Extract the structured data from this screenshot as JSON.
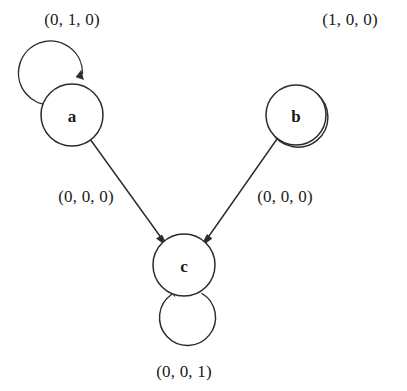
{
  "diagram": {
    "type": "state-transition-graph",
    "title": "",
    "stroke_color": "#2b2b2b",
    "label_color": "#1a1a1a",
    "background_color": "#ffffff",
    "nodes": [
      {
        "id": "a",
        "label": "a",
        "cx": 72,
        "cy": 115,
        "r": 31
      },
      {
        "id": "b",
        "label": "b",
        "cx": 296,
        "cy": 115,
        "r": 30
      },
      {
        "id": "c",
        "label": "c",
        "cx": 184,
        "cy": 265,
        "r": 31
      }
    ],
    "self_loops": [
      {
        "id": "loop-a",
        "node": "a",
        "label": "(0, 1, 0)",
        "label_x": 72,
        "label_y": 19,
        "cx": 52,
        "cy": 67,
        "r": 32
      },
      {
        "id": "loop-b",
        "node": "b",
        "label": "(1, 0, 0)",
        "label_x": 350,
        "label_y": 19,
        "cx": 330,
        "cy": 66,
        "r": 30
      },
      {
        "id": "loop-c",
        "node": "c",
        "label": "(0, 0, 1)",
        "label_x": 184,
        "label_y": 371,
        "cx": 183,
        "cy": 320,
        "r": 28
      }
    ],
    "edges": [
      {
        "id": "edge-a-c",
        "from": "a",
        "to": "c",
        "label": "(0, 0, 0)",
        "label_x": 86,
        "label_y": 196,
        "x1": 90,
        "y1": 139,
        "x2": 165,
        "y2": 243
      },
      {
        "id": "edge-b-c",
        "from": "b",
        "to": "c",
        "label": "(0, 0, 0)",
        "label_x": 285,
        "label_y": 196,
        "x1": 277,
        "y1": 139,
        "x2": 204,
        "y2": 243
      }
    ]
  }
}
